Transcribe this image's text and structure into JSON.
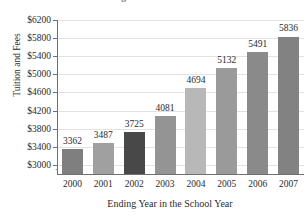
{
  "chart_data": {
    "type": "bar",
    "title": "College Tuition and Fees",
    "title_clipped": true,
    "xlabel": "Ending Year in the School Year",
    "ylabel": "Tuition and Fees",
    "categories": [
      "2000",
      "2001",
      "2002",
      "2003",
      "2004",
      "2005",
      "2006",
      "2007"
    ],
    "values": [
      3362,
      3487,
      3725,
      4081,
      4694,
      5132,
      5491,
      5836
    ],
    "value_labels": [
      "3362",
      "3487",
      "3725",
      "4081",
      "4694",
      "5132",
      "5491",
      "5836"
    ],
    "bar_colors": [
      "#7f7f7f",
      "#a0a0a0",
      "#484848",
      "#949494",
      "#b8b8b8",
      "#9a9a9a",
      "#8a8a8a",
      "#828282"
    ],
    "ylim": [
      2800,
      6200
    ],
    "ytick_values": [
      6200,
      5800,
      5400,
      5000,
      4600,
      4200,
      3800,
      3400,
      3000
    ],
    "ytick_labels": [
      "$6200",
      "$5800",
      "$5400",
      "$5000",
      "$4600",
      "$4200",
      "$3800",
      "$3400",
      "$3000"
    ],
    "grid": true,
    "grid_axis": "y",
    "legend": false,
    "axis_color": "#6f6f6f",
    "grid_color": "#e2e2e2",
    "text_color": "#2b2b2b"
  }
}
